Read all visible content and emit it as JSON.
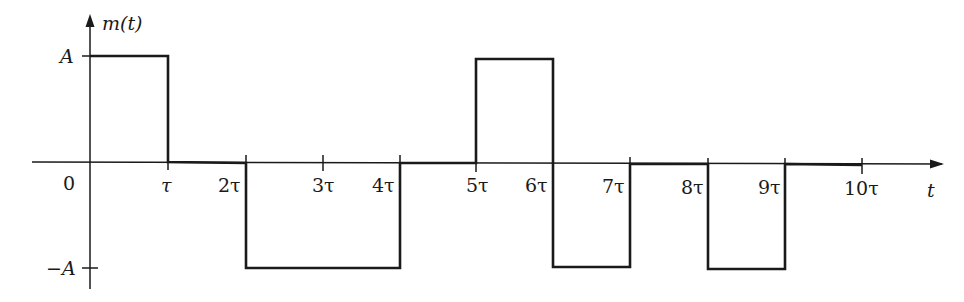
{
  "diagram": {
    "y_axis_label": "m(t)",
    "x_axis_label": "t",
    "origin_label": "0",
    "y_ticks": [
      {
        "label": "A",
        "value": 1
      },
      {
        "label": "−A",
        "value": -1
      }
    ],
    "x_ticks": [
      {
        "label": "τ",
        "value": 1
      },
      {
        "label": "2τ",
        "value": 2
      },
      {
        "label": "3τ",
        "value": 3
      },
      {
        "label": "4τ",
        "value": 4
      },
      {
        "label": "5τ",
        "value": 5
      },
      {
        "label": "6τ",
        "value": 6
      },
      {
        "label": "7τ",
        "value": 7
      },
      {
        "label": "8τ",
        "value": 8
      },
      {
        "label": "9τ",
        "value": 9
      },
      {
        "label": "10τ",
        "value": 10
      }
    ],
    "waveform_segments": [
      {
        "from": 0,
        "to": 1,
        "level": "A"
      },
      {
        "from": 1,
        "to": 2,
        "level": "0"
      },
      {
        "from": 2,
        "to": 4,
        "level": "−A"
      },
      {
        "from": 4,
        "to": 5,
        "level": "0"
      },
      {
        "from": 5,
        "to": 6,
        "level": "A"
      },
      {
        "from": 6,
        "to": 7,
        "level": "−A"
      },
      {
        "from": 7,
        "to": 8,
        "level": "0"
      },
      {
        "from": 8,
        "to": 9,
        "level": "−A"
      },
      {
        "from": 9,
        "to": 10.5,
        "level": "0"
      }
    ],
    "line_color": "#1a1a1a"
  }
}
